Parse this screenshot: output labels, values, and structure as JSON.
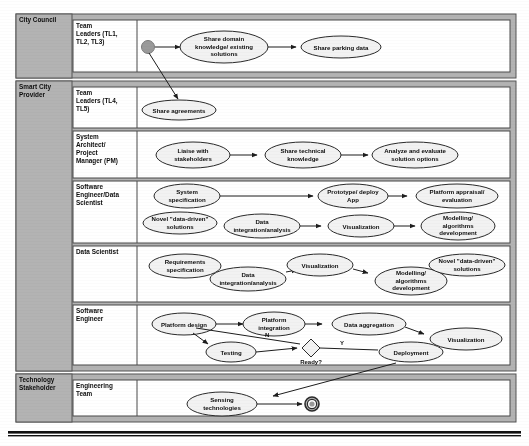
{
  "diagram": {
    "type": "bpmn-swimlane",
    "colors": {
      "pool_header_fill": "#b3b3b3",
      "lane_fill": "#ffffff",
      "node_fill": "#f2f2f2",
      "stroke": "#2b2b2b",
      "start_node_fill": "#9a9a9a"
    }
  },
  "pools": [
    {
      "id": "city-council",
      "label": "City Council",
      "lanes": [
        {
          "id": "team-leaders-123",
          "label": "Team Leaders (TL1, TL2, TL3)",
          "nodes": [
            {
              "id": "start",
              "kind": "start-event",
              "label": ""
            },
            {
              "id": "share-domain-knowledge",
              "kind": "activity",
              "label": "Share domain knowledge/ existing solutions"
            },
            {
              "id": "share-parking-data",
              "kind": "activity",
              "label": "Share parking data"
            }
          ]
        }
      ]
    },
    {
      "id": "smart-city-provider",
      "label": "Smart City Provider",
      "lanes": [
        {
          "id": "team-leaders-45",
          "label": "Team Leaders (TL4, TL5)",
          "nodes": [
            {
              "id": "share-agreements",
              "kind": "activity",
              "label": "Share agreements"
            }
          ]
        },
        {
          "id": "system-architect-pm",
          "label": "System Architect/ Project Manager (PM)",
          "nodes": [
            {
              "id": "liaise-stakeholders",
              "kind": "activity",
              "label": "Liaise with stakeholders"
            },
            {
              "id": "share-technical-knowledge",
              "kind": "activity",
              "label": "Share technical knowledge"
            },
            {
              "id": "analyze-evaluate-solutions",
              "kind": "activity",
              "label": "Analyze and evaluate solution options"
            }
          ]
        },
        {
          "id": "software-engineer-data-scientist",
          "label": "Software Engineer/Data Scientist",
          "nodes": [
            {
              "id": "system-specification",
              "kind": "activity",
              "label": "System specification"
            },
            {
              "id": "prototype-deploy-app",
              "kind": "activity",
              "label": "Prototype/ deploy App"
            },
            {
              "id": "platform-appraisal-evaluation",
              "kind": "activity",
              "label": "Platform appraisal/ evaluation"
            },
            {
              "id": "novel-data-driven-solutions-1",
              "kind": "activity",
              "label": "Novel \"data-driven\" solutions"
            },
            {
              "id": "data-integration-analysis-1",
              "kind": "activity",
              "label": "Data integration/analysis"
            },
            {
              "id": "visualization-1",
              "kind": "activity",
              "label": "Visualization"
            },
            {
              "id": "modelling-algorithms-development-1",
              "kind": "activity",
              "label": "Modelling/ algorithms development"
            }
          ]
        },
        {
          "id": "data-scientist",
          "label": "Data Scientist",
          "nodes": [
            {
              "id": "requirements-specification",
              "kind": "activity",
              "label": "Requirements specification"
            },
            {
              "id": "data-integration-analysis-2",
              "kind": "activity",
              "label": "Data integration/analysis"
            },
            {
              "id": "visualization-2",
              "kind": "activity",
              "label": "Visualization"
            },
            {
              "id": "modelling-algorithms-development-2",
              "kind": "activity",
              "label": "Modelling/ algorithms development"
            },
            {
              "id": "novel-data-driven-solutions-2",
              "kind": "activity",
              "label": "Novel \"data-driven\" solutions"
            }
          ]
        },
        {
          "id": "software-engineer",
          "label": "Software Engineer",
          "nodes": [
            {
              "id": "platform-design",
              "kind": "activity",
              "label": "Platform design"
            },
            {
              "id": "platform-integration",
              "kind": "activity",
              "label": "Platform integration"
            },
            {
              "id": "data-aggregation",
              "kind": "activity",
              "label": "Data aggregation"
            },
            {
              "id": "visualization-3",
              "kind": "activity",
              "label": "Visualization"
            },
            {
              "id": "testing",
              "kind": "activity",
              "label": "Testing"
            },
            {
              "id": "ready-decision",
              "kind": "gateway",
              "label": "Ready?"
            },
            {
              "id": "deployment",
              "kind": "activity",
              "label": "Deployment"
            }
          ],
          "edge_labels": [
            {
              "id": "edge-label-no",
              "label": "N"
            },
            {
              "id": "edge-label-yes",
              "label": "Y"
            }
          ]
        }
      ]
    },
    {
      "id": "technology-stakeholder",
      "label": "Technology Stakeholder",
      "lanes": [
        {
          "id": "engineering-team",
          "label": "Engineering Team",
          "nodes": [
            {
              "id": "sensing-technologies",
              "kind": "activity",
              "label": "Sensing technologies"
            },
            {
              "id": "end",
              "kind": "end-event",
              "label": ""
            }
          ]
        }
      ]
    }
  ],
  "labels": {
    "pool_city_council": "City Council",
    "pool_smart_city_provider_l1": "Smart City",
    "pool_smart_city_provider_l2": "Provider",
    "pool_technology_stakeholder_l1": "Technology",
    "pool_technology_stakeholder_l2": "Stakeholder",
    "lane_tl123_l1": "Team",
    "lane_tl123_l2": "Leaders (TL1,",
    "lane_tl123_l3": "TL2, TL3)",
    "lane_tl45_l1": "Team",
    "lane_tl45_l2": "Leaders (TL4,",
    "lane_tl45_l3": "TL5)",
    "lane_sapm_l1": "System",
    "lane_sapm_l2": "Architect/",
    "lane_sapm_l3": "Project",
    "lane_sapm_l4": "Manager (PM)",
    "lane_seds_l1": "Software",
    "lane_seds_l2": "Engineer/Data",
    "lane_seds_l3": "Scientist",
    "lane_ds_l1": "Data Scientist",
    "lane_se_l1": "Software",
    "lane_se_l2": "Engineer",
    "lane_eng_l1": "Engineering",
    "lane_eng_l2": "Team",
    "n_share_domain_l1": "Share domain",
    "n_share_domain_l2": "knowledge/ existing",
    "n_share_domain_l3": "solutions",
    "n_share_parking": "Share parking data",
    "n_share_agreements": "Share agreements",
    "n_liaise_l1": "Liaise with",
    "n_liaise_l2": "stakeholders",
    "n_share_tech_l1": "Share technical",
    "n_share_tech_l2": "knowledge",
    "n_analyze_l1": "Analyze and evaluate",
    "n_analyze_l2": "solution options",
    "n_sysspec_l1": "System",
    "n_sysspec_l2": "specification",
    "n_proto_l1": "Prototype/ deploy",
    "n_proto_l2": "App",
    "n_appraisal_l1": "Platform appraisal/",
    "n_appraisal_l2": "evaluation",
    "n_novel1_l1": "Novel \"data-driven\"",
    "n_novel1_l2": "solutions",
    "n_dataint1_l1": "Data",
    "n_dataint1_l2": "integration/analysis",
    "n_vis1": "Visualization",
    "n_model1_l1": "Modelling/",
    "n_model1_l2": "algorithms",
    "n_model1_l3": "development",
    "n_reqspec_l1": "Requirements",
    "n_reqspec_l2": "specification",
    "n_dataint2_l1": "Data",
    "n_dataint2_l2": "integration/analysis",
    "n_vis2": "Visualization",
    "n_model2_l1": "Modelling/",
    "n_model2_l2": "algorithms",
    "n_model2_l3": "development",
    "n_novel2_l1": "Novel \"data-driven\"",
    "n_novel2_l2": "solutions",
    "n_platdesign": "Platform design",
    "n_platint_l1": "Platform",
    "n_platint_l2": "integration",
    "n_dataagg": "Data aggregation",
    "n_vis3": "Visualization",
    "n_testing": "Testing",
    "n_ready": "Ready?",
    "n_deployment": "Deployment",
    "edge_n": "N",
    "edge_y": "Y",
    "n_sensing_l1": "Sensing",
    "n_sensing_l2": "technologies"
  }
}
